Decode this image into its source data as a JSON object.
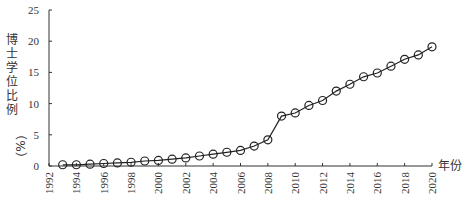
{
  "chart_data": {
    "type": "line",
    "title": "",
    "xlabel": "年份",
    "ylabel": "博士学位比例（%）",
    "ylim": [
      0,
      25
    ],
    "xlim": [
      1992,
      2020
    ],
    "grid": false,
    "legend": null,
    "y_ticks": [
      0,
      5,
      10,
      15,
      20,
      25
    ],
    "x_ticks": [
      1992,
      1994,
      1996,
      1998,
      2000,
      2002,
      2004,
      2006,
      2008,
      2010,
      2012,
      2014,
      2016,
      2018,
      2020
    ],
    "marker": "open-circle",
    "series": [
      {
        "name": "博士学位比例",
        "x": [
          1993,
          1994,
          1995,
          1996,
          1997,
          1998,
          1999,
          2000,
          2001,
          2002,
          2003,
          2004,
          2005,
          2006,
          2007,
          2008,
          2009,
          2010,
          2011,
          2012,
          2013,
          2014,
          2015,
          2016,
          2017,
          2018,
          2019,
          2020
        ],
        "values": [
          0.2,
          0.2,
          0.3,
          0.4,
          0.5,
          0.6,
          0.8,
          0.9,
          1.1,
          1.3,
          1.6,
          1.9,
          2.2,
          2.5,
          3.2,
          4.2,
          8.0,
          8.5,
          9.7,
          10.5,
          12.0,
          13.1,
          14.3,
          14.9,
          16.0,
          17.1,
          17.8,
          19.1
        ]
      }
    ]
  },
  "labels": {
    "xlabel": "年份",
    "ylabel_main": "博士学位比例",
    "ylabel_unit": "（%）"
  }
}
